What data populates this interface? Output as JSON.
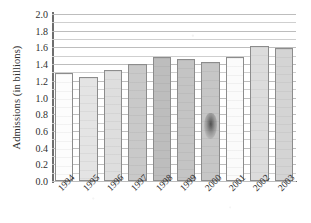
{
  "chart_data": {
    "type": "bar",
    "title": "",
    "xlabel": "",
    "ylabel": "Admissions (in billions)",
    "categories": [
      "1994",
      "1995",
      "1996",
      "1997",
      "1998",
      "1999",
      "2000",
      "2001",
      "2002",
      "2003"
    ],
    "values": [
      1.29,
      1.25,
      1.33,
      1.4,
      1.48,
      1.46,
      1.42,
      1.49,
      1.62,
      1.59
    ],
    "ylim": [
      0.0,
      2.0
    ],
    "ytick_labels": [
      "0.0",
      "0.2",
      "0.4",
      "0.6",
      "0.8",
      "1.0",
      "1.2",
      "1.4",
      "1.6",
      "1.8",
      "2.0"
    ],
    "ytick_values": [
      0.0,
      0.2,
      0.4,
      0.6,
      0.8,
      1.0,
      1.2,
      1.4,
      1.6,
      1.8,
      2.0
    ],
    "minor_gridline_step": 0.1,
    "grid": true,
    "grid_orientation": "horizontal",
    "legend": "none",
    "bar_colors": [
      "#fdfdfd",
      "#e4e4e4",
      "#dedede",
      "#c9c9c9",
      "#bdbdbd",
      "#c4c4c4",
      "#c6c6c6",
      "#fbfbfb",
      "#dcdcdc",
      "#d4d4d4"
    ],
    "bar_edge_color": "#8c8c8c",
    "annotations": [
      {
        "name": "smudge-artifact",
        "description": "dark ink smudge on the 2000 bar",
        "x_category": "2000",
        "y_center": 0.66
      }
    ]
  }
}
